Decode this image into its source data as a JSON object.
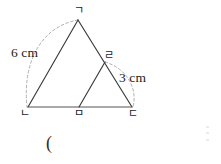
{
  "figure": {
    "stroke_color": "#3a3a3a",
    "dash_color": "#9a9a9a",
    "background": "#ffffff",
    "vertices": {
      "apex": {
        "name": "ga",
        "label": "ㄱ",
        "x": 78,
        "y": 20
      },
      "bottom_left": {
        "name": "na",
        "label": "ㄴ",
        "x": 28,
        "y": 107
      },
      "bottom_mid": {
        "name": "ma",
        "label": "ㅁ",
        "x": 79,
        "y": 107
      },
      "bottom_right": {
        "name": "da",
        "label": "ㄷ",
        "x": 132,
        "y": 107
      },
      "mid_right": {
        "name": "ra",
        "label": "ㄹ",
        "x": 105,
        "y": 62
      }
    },
    "segments": [
      {
        "name": "ga-na",
        "from": "apex",
        "to": "bottom_left"
      },
      {
        "name": "ga-da",
        "from": "apex",
        "to": "bottom_right"
      },
      {
        "name": "na-da",
        "from": "bottom_left",
        "to": "bottom_right"
      },
      {
        "name": "ma-ra",
        "from": "bottom_mid",
        "to": "mid_right"
      },
      {
        "name": "ra-da",
        "from": "mid_right",
        "to": "bottom_right"
      }
    ],
    "measure_arcs": [
      {
        "name": "arc-6cm",
        "from": "apex",
        "to": "bottom_left",
        "label": "6 cm"
      },
      {
        "name": "arc-3cm",
        "from": "mid_right",
        "to": "bottom_right",
        "label": "3 cm"
      }
    ],
    "labels": {
      "length_left": "6 cm",
      "length_right": "3 cm"
    }
  },
  "answer": {
    "open_paren": "("
  }
}
